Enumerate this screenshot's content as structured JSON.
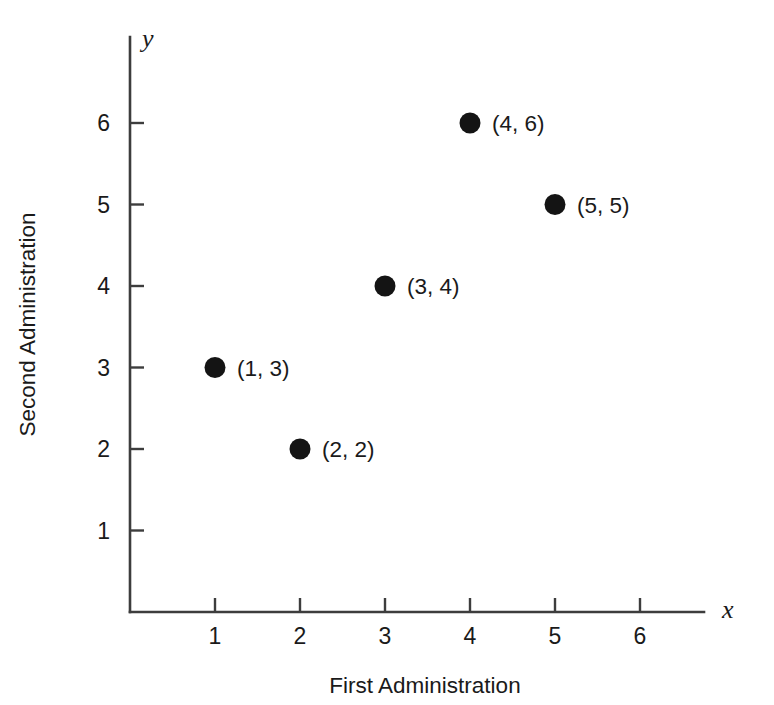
{
  "chart_data": {
    "type": "scatter",
    "title": "",
    "xlabel": "First Administration",
    "ylabel": "Second Administration",
    "x_axis_symbol": "x",
    "y_axis_symbol": "y",
    "xlim": [
      0,
      6.9
    ],
    "ylim": [
      0,
      6.9
    ],
    "grid": false,
    "legend": null,
    "x_ticks": [
      1,
      2,
      3,
      4,
      5,
      6
    ],
    "y_ticks": [
      1,
      2,
      3,
      4,
      5,
      6
    ],
    "x_tick_labels": [
      "1",
      "2",
      "3",
      "4",
      "5",
      "6"
    ],
    "y_tick_labels": [
      "1",
      "2",
      "3",
      "4",
      "5",
      "6"
    ],
    "marker": "filled-circle",
    "marker_color": "#141414",
    "axis_color": "#3d3d3d",
    "background_color": "#ffffff",
    "points": [
      {
        "x": 1,
        "y": 3,
        "label": "(1, 3)"
      },
      {
        "x": 2,
        "y": 2,
        "label": "(2, 2)"
      },
      {
        "x": 3,
        "y": 4,
        "label": "(3, 4)"
      },
      {
        "x": 4,
        "y": 6,
        "label": "(4, 6)"
      },
      {
        "x": 5,
        "y": 5,
        "label": "(5, 5)"
      }
    ]
  },
  "figure": {
    "width": 774,
    "height": 705,
    "origin_px": {
      "x": 130,
      "y": 612
    },
    "x_unit_px": 85,
    "y_unit_px": 81.5,
    "dot_radius_px": 10.5,
    "tick_length_px": 14,
    "point_label_offset_px": 22,
    "x_axis_end_px": 704,
    "y_axis_top_px": 37
  }
}
